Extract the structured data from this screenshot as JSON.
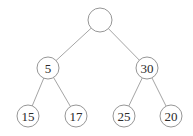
{
  "tree": {
    "nodes": [
      {
        "id": "root",
        "label": "",
        "cx": 100,
        "cy": 20,
        "r": 12
      },
      {
        "id": "n5",
        "label": "5",
        "cx": 48,
        "cy": 68,
        "r": 11
      },
      {
        "id": "n30",
        "label": "30",
        "cx": 147,
        "cy": 68,
        "r": 11
      },
      {
        "id": "n15",
        "label": "15",
        "cx": 28,
        "cy": 116,
        "r": 11
      },
      {
        "id": "n17",
        "label": "17",
        "cx": 76,
        "cy": 116,
        "r": 11
      },
      {
        "id": "n25",
        "label": "25",
        "cx": 124,
        "cy": 116,
        "r": 11
      },
      {
        "id": "n20",
        "label": "20",
        "cx": 171,
        "cy": 116,
        "r": 11
      }
    ],
    "edges": [
      {
        "from": "root",
        "to": "n5"
      },
      {
        "from": "root",
        "to": "n30"
      },
      {
        "from": "n5",
        "to": "n15"
      },
      {
        "from": "n5",
        "to": "n17"
      },
      {
        "from": "n30",
        "to": "n25"
      },
      {
        "from": "n30",
        "to": "n20"
      }
    ]
  }
}
